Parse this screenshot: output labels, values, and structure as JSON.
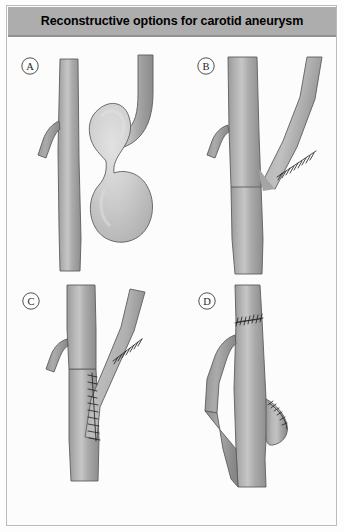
{
  "figure": {
    "title": "Reconstructive options for carotid aneurysm",
    "border_color": "#b9bcbe",
    "background_color": "#fcfcfc"
  },
  "header": {
    "background_color": "#adadad",
    "text_color": "#000000",
    "title": "Reconstructive options for carotid aneurysm"
  },
  "colors": {
    "vessel_fill": "#a6a6a6",
    "vessel_light": "#c4c4c4",
    "vessel_shadow": "#8f8f8f",
    "vessel_outline": "#5c5c5c",
    "aneurysm_fill": "#c9c9c9",
    "aneurysm_highlight": "#dedede",
    "suture_color": "#2b2b2b",
    "label_color": "#262626"
  },
  "panels": [
    {
      "id": "panel-a",
      "label": "A",
      "label_x": 23,
      "label_y": 27,
      "description": "Carotid bifurcation with large saccular aneurysm arising from the internal carotid artery"
    },
    {
      "id": "panel-b",
      "label": "B",
      "label_x": 199,
      "label_y": 27,
      "description": "Aneurysm resection with primary end-to-end anastomosis of the internal carotid artery"
    },
    {
      "id": "panel-c",
      "label": "C",
      "label_x": 24,
      "label_y": 262,
      "description": "Aneurysm resection with interposition graft and patch reconstruction of the bifurcation"
    },
    {
      "id": "panel-d",
      "label": "D",
      "label_x": 200,
      "label_y": 262,
      "description": "Aneurysm resection with external carotid artery ligation and stump closure"
    }
  ]
}
